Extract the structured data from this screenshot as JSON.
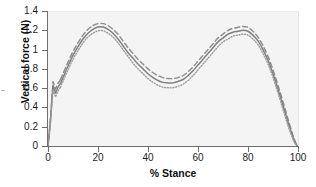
{
  "chart_data": {
    "type": "line",
    "title": "",
    "xlabel": "% Stance",
    "ylabel": "Vertical force (N)",
    "xlim": [
      0,
      100
    ],
    "ylim": [
      0,
      1.4
    ],
    "grid": false,
    "legend": "none",
    "x_ticks": [
      {
        "value": 0,
        "label": "0"
      },
      {
        "value": 20,
        "label": "20"
      },
      {
        "value": 40,
        "label": "40"
      },
      {
        "value": 60,
        "label": "60"
      },
      {
        "value": 80,
        "label": "80"
      },
      {
        "value": 100,
        "label": "100"
      }
    ],
    "y_ticks": [
      {
        "value": 0,
        "label": "0"
      },
      {
        "value": 0.2,
        "label": "0.2"
      },
      {
        "value": 0.4,
        "label": "0.4"
      },
      {
        "value": 0.6,
        "label": "0.6"
      },
      {
        "value": 0.8,
        "label": "0.8"
      },
      {
        "value": 1.0,
        "label": "1"
      },
      {
        "value": 1.2,
        "label": "1.2"
      },
      {
        "value": 1.4,
        "label": "1.4"
      }
    ],
    "x": [
      0,
      1,
      2,
      3,
      4,
      5,
      6,
      8,
      10,
      12,
      14,
      16,
      18,
      20,
      22,
      24,
      26,
      28,
      30,
      32,
      34,
      36,
      38,
      40,
      42,
      44,
      46,
      48,
      50,
      52,
      54,
      56,
      58,
      60,
      62,
      64,
      66,
      68,
      70,
      72,
      74,
      76,
      78,
      80,
      82,
      84,
      86,
      88,
      90,
      92,
      94,
      96,
      98,
      99,
      100
    ],
    "series": [
      {
        "name": "mean plus SD",
        "style": "dashed",
        "color": "#8c8c8c",
        "values": [
          0.0,
          0.3,
          0.68,
          0.6,
          0.66,
          0.7,
          0.76,
          0.88,
          0.99,
          1.08,
          1.16,
          1.22,
          1.26,
          1.28,
          1.28,
          1.26,
          1.22,
          1.17,
          1.1,
          1.03,
          0.97,
          0.91,
          0.86,
          0.81,
          0.77,
          0.74,
          0.72,
          0.71,
          0.71,
          0.72,
          0.74,
          0.78,
          0.83,
          0.89,
          0.95,
          1.01,
          1.07,
          1.13,
          1.17,
          1.21,
          1.23,
          1.24,
          1.25,
          1.24,
          1.2,
          1.14,
          1.05,
          0.94,
          0.8,
          0.64,
          0.47,
          0.29,
          0.12,
          0.05,
          0.0
        ]
      },
      {
        "name": "mean",
        "style": "solid",
        "color": "#808080",
        "values": [
          0.0,
          0.28,
          0.64,
          0.56,
          0.62,
          0.66,
          0.72,
          0.84,
          0.95,
          1.04,
          1.12,
          1.18,
          1.22,
          1.245,
          1.245,
          1.22,
          1.18,
          1.12,
          1.05,
          0.98,
          0.92,
          0.86,
          0.81,
          0.76,
          0.72,
          0.69,
          0.67,
          0.665,
          0.665,
          0.68,
          0.7,
          0.74,
          0.79,
          0.85,
          0.91,
          0.97,
          1.03,
          1.09,
          1.13,
          1.17,
          1.19,
          1.2,
          1.21,
          1.2,
          1.16,
          1.1,
          1.01,
          0.9,
          0.76,
          0.6,
          0.43,
          0.26,
          0.1,
          0.04,
          0.0
        ]
      },
      {
        "name": "mean minus SD",
        "style": "dotted",
        "color": "#9a9a9a",
        "values": [
          0.0,
          0.25,
          0.6,
          0.52,
          0.58,
          0.62,
          0.68,
          0.8,
          0.91,
          1.0,
          1.08,
          1.14,
          1.18,
          1.205,
          1.205,
          1.18,
          1.14,
          1.08,
          1.01,
          0.94,
          0.87,
          0.81,
          0.76,
          0.71,
          0.67,
          0.64,
          0.62,
          0.615,
          0.615,
          0.63,
          0.65,
          0.69,
          0.74,
          0.8,
          0.86,
          0.92,
          0.98,
          1.04,
          1.09,
          1.12,
          1.15,
          1.16,
          1.17,
          1.16,
          1.12,
          1.06,
          0.97,
          0.86,
          0.72,
          0.56,
          0.39,
          0.22,
          0.08,
          0.03,
          0.0
        ]
      }
    ],
    "annotations": {
      "initial_transient_peak": 0.68,
      "first_peak_x": 21,
      "midstance_trough_x": 48,
      "second_peak_x": 78
    }
  }
}
